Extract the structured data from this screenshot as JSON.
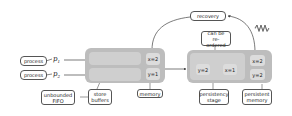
{
  "diagram": {
    "processes": [
      {
        "label": "process",
        "var": "p",
        "sub": "1"
      },
      {
        "label": "process",
        "var": "p",
        "sub": "2"
      }
    ],
    "store_buffers": {
      "caption": "store buffers",
      "caption_line1": "store",
      "caption_line2": "buffers",
      "fifo_note_line1": "unbounded",
      "fifo_note_line2": "FIFO"
    },
    "memory": {
      "caption": "memory",
      "cells": [
        "x=2",
        "y=1"
      ]
    },
    "persistency_stage": {
      "caption_line1": "persistency",
      "caption_line2": "stage",
      "cells": [
        "y=2",
        "x=1"
      ],
      "note_line1": "can be",
      "note_line2": "re-ordered"
    },
    "persistent_memory": {
      "caption_line1": "persistent",
      "caption_line2": "memory",
      "cells": [
        "x=2",
        "y=2"
      ]
    },
    "recovery": {
      "label": "recovery"
    },
    "crash_icon": "zigzag-crash-icon",
    "colors": {
      "group_fill": "#bdbdbd",
      "lane_fill": "#cfcfcf",
      "cell_fill": "#dcdcdc",
      "stroke": "#555555"
    }
  }
}
